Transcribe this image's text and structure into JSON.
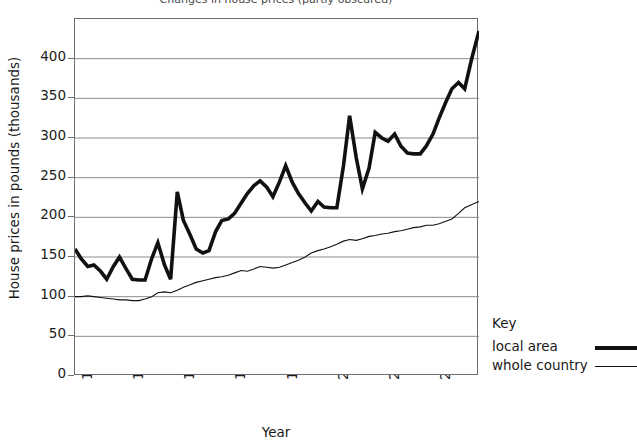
{
  "chart_data": {
    "type": "line",
    "title": "Changes in house prices (partly obscured)",
    "xlabel": "Year",
    "ylabel": "House prices in pounds (thousands)",
    "ylim": [
      0,
      450
    ],
    "y_ticks": [
      0,
      50,
      100,
      150,
      200,
      250,
      300,
      350,
      400
    ],
    "x_ticks": [
      "1995",
      "1996",
      "1997",
      "1998",
      "1999",
      "2000",
      "2001",
      "2002"
    ],
    "xlim": [
      1995,
      2002.9
    ],
    "grid": true,
    "legend_position": "right",
    "series": [
      {
        "name": "local area",
        "style": "thick",
        "color": "#111111",
        "x": [
          1995.0,
          1995.12,
          1995.25,
          1995.37,
          1995.5,
          1995.62,
          1995.75,
          1995.87,
          1996.0,
          1996.12,
          1996.25,
          1996.37,
          1996.5,
          1996.62,
          1996.75,
          1996.87,
          1997.0,
          1997.12,
          1997.25,
          1997.37,
          1997.5,
          1997.62,
          1997.75,
          1997.87,
          1998.0,
          1998.12,
          1998.25,
          1998.37,
          1998.5,
          1998.62,
          1998.75,
          1998.87,
          1999.0,
          1999.12,
          1999.25,
          1999.37,
          1999.5,
          1999.62,
          1999.75,
          1999.87,
          2000.0,
          2000.12,
          2000.25,
          2000.37,
          2000.5,
          2000.62,
          2000.75,
          2000.87,
          2001.0,
          2001.12,
          2001.25,
          2001.37,
          2001.5,
          2001.62,
          2001.75,
          2001.87,
          2002.0,
          2002.12,
          2002.25,
          2002.37,
          2002.5,
          2002.62,
          2002.75,
          2002.9
        ],
        "values": [
          160,
          148,
          138,
          140,
          132,
          122,
          138,
          150,
          135,
          122,
          121,
          121,
          148,
          168,
          140,
          122,
          232,
          196,
          178,
          160,
          155,
          158,
          182,
          196,
          198,
          205,
          218,
          230,
          240,
          246,
          238,
          226,
          245,
          265,
          244,
          230,
          218,
          208,
          220,
          213,
          212,
          212,
          265,
          328,
          275,
          236,
          262,
          307,
          300,
          296,
          305,
          290,
          281,
          280,
          280,
          290,
          305,
          325,
          345,
          362,
          370,
          362,
          398,
          435
        ]
      },
      {
        "name": "whole country",
        "style": "thin",
        "color": "#111111",
        "x": [
          1995.0,
          1995.12,
          1995.25,
          1995.37,
          1995.5,
          1995.62,
          1995.75,
          1995.87,
          1996.0,
          1996.12,
          1996.25,
          1996.37,
          1996.5,
          1996.62,
          1996.75,
          1996.87,
          1997.0,
          1997.12,
          1997.25,
          1997.37,
          1997.5,
          1997.62,
          1997.75,
          1997.87,
          1998.0,
          1998.12,
          1998.25,
          1998.37,
          1998.5,
          1998.62,
          1998.75,
          1998.87,
          1999.0,
          1999.12,
          1999.25,
          1999.37,
          1999.5,
          1999.62,
          1999.75,
          1999.87,
          2000.0,
          2000.12,
          2000.25,
          2000.37,
          2000.5,
          2000.62,
          2000.75,
          2000.87,
          2001.0,
          2001.12,
          2001.25,
          2001.37,
          2001.5,
          2001.62,
          2001.75,
          2001.87,
          2002.0,
          2002.12,
          2002.25,
          2002.37,
          2002.5,
          2002.62,
          2002.75,
          2002.9
        ],
        "values": [
          100,
          100,
          101,
          100,
          99,
          98,
          97,
          96,
          96,
          95,
          95,
          97,
          100,
          105,
          106,
          105,
          108,
          112,
          115,
          118,
          120,
          122,
          124,
          125,
          127,
          130,
          133,
          132,
          135,
          138,
          137,
          136,
          137,
          140,
          143,
          146,
          150,
          155,
          158,
          160,
          163,
          166,
          170,
          172,
          171,
          173,
          176,
          177,
          179,
          180,
          182,
          183,
          185,
          187,
          188,
          190,
          190,
          192,
          195,
          198,
          205,
          212,
          216,
          220
        ]
      }
    ]
  },
  "legend": {
    "title": "Key",
    "items": [
      {
        "label": "local area",
        "style": "thick"
      },
      {
        "label": "whole country",
        "style": "thin"
      }
    ]
  }
}
